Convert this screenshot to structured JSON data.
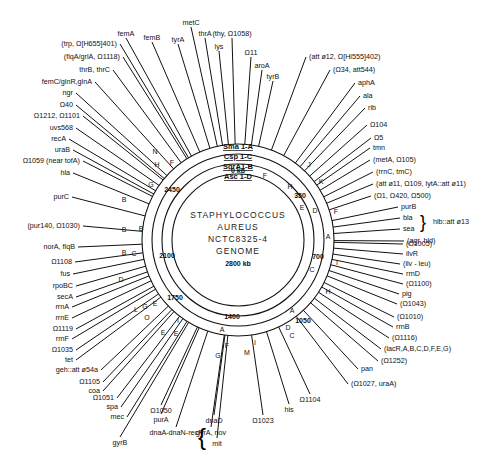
{
  "title": {
    "lines": [
      "STAPHYLOCOCCUS",
      "AUREUS",
      "NCTC8325-4",
      "GENOME"
    ],
    "size": "2800 kb"
  },
  "rings": [
    {
      "name": "Sma 1",
      "label": "Sma 1-A",
      "radius": 96
    },
    {
      "name": "Csp 1",
      "label": "Csp 1-C",
      "radius": 86
    },
    {
      "name": "SgrA1",
      "label": "SgrA1-B",
      "radius": 76
    },
    {
      "name": "Asc 1",
      "label": "Asc 1-D",
      "radius": 66
    }
  ],
  "kb_ticks": [
    {
      "label": "0 kb",
      "x": 238,
      "y": 173
    },
    {
      "label": "350",
      "x": 300,
      "y": 198
    },
    {
      "label": "700",
      "x": 318,
      "y": 259
    },
    {
      "label": "1050",
      "x": 303,
      "y": 323
    },
    {
      "label": "1400",
      "x": 232,
      "y": 319
    },
    {
      "label": "1750",
      "x": 175,
      "y": 300
    },
    {
      "label": "2100",
      "x": 167,
      "y": 258
    },
    {
      "label": "2450",
      "x": 172,
      "y": 192
    }
  ],
  "segments": [
    {
      "t": "F",
      "x": 265,
      "y": 178
    },
    {
      "t": "H",
      "x": 290,
      "y": 189
    },
    {
      "t": "J",
      "x": 309,
      "y": 167
    },
    {
      "t": "K",
      "x": 321,
      "y": 184
    },
    {
      "t": "E",
      "x": 302,
      "y": 210
    },
    {
      "t": "D",
      "x": 315,
      "y": 213
    },
    {
      "t": "F",
      "x": 336,
      "y": 214
    },
    {
      "t": "A",
      "x": 328,
      "y": 239
    },
    {
      "t": "I",
      "x": 337,
      "y": 265
    },
    {
      "t": "C",
      "x": 312,
      "y": 272
    },
    {
      "t": "H",
      "x": 328,
      "y": 294
    },
    {
      "t": "A",
      "x": 292,
      "y": 313
    },
    {
      "t": "D",
      "x": 288,
      "y": 330
    },
    {
      "t": "C",
      "x": 292,
      "y": 338
    },
    {
      "t": "I",
      "x": 255,
      "y": 345
    },
    {
      "t": "M",
      "x": 247,
      "y": 355
    },
    {
      "t": "A",
      "x": 222,
      "y": 332
    },
    {
      "t": "F",
      "x": 227,
      "y": 348
    },
    {
      "t": "G",
      "x": 218,
      "y": 358
    },
    {
      "t": "I",
      "x": 178,
      "y": 323
    },
    {
      "t": "E",
      "x": 176,
      "y": 336
    },
    {
      "t": "E",
      "x": 163,
      "y": 335
    },
    {
      "t": "E",
      "x": 155,
      "y": 306
    },
    {
      "t": "G",
      "x": 145,
      "y": 309
    },
    {
      "t": "L",
      "x": 136,
      "y": 312
    },
    {
      "t": "O",
      "x": 147,
      "y": 320
    },
    {
      "t": "D",
      "x": 121,
      "y": 282
    },
    {
      "t": "C",
      "x": 134,
      "y": 256
    },
    {
      "t": "B",
      "x": 124,
      "y": 255
    },
    {
      "t": "B",
      "x": 141,
      "y": 231
    },
    {
      "t": "B",
      "x": 124,
      "y": 202
    },
    {
      "t": "B",
      "x": 124,
      "y": 232
    },
    {
      "t": "G",
      "x": 151,
      "y": 187
    },
    {
      "t": "H",
      "x": 157,
      "y": 167
    },
    {
      "t": "F",
      "x": 172,
      "y": 165
    },
    {
      "t": "N",
      "x": 155,
      "y": 154
    }
  ],
  "genes_top": [
    {
      "t": "femA",
      "x": 126,
      "y": 36
    },
    {
      "t": "femB",
      "x": 152,
      "y": 40
    },
    {
      "t": "tyrA",
      "x": 178,
      "y": 42
    },
    {
      "t": "metC",
      "x": 191,
      "y": 25
    },
    {
      "t": "thrA",
      "x": 205,
      "y": 36
    },
    {
      "t": "lys",
      "x": 219,
      "y": 49
    },
    {
      "t": "(thy, Ω1058)",
      "x": 232,
      "y": 36
    },
    {
      "t": "Ω11",
      "x": 251,
      "y": 55
    },
    {
      "t": "aroA",
      "x": 262,
      "y": 68
    },
    {
      "t": "tyrB",
      "x": 273,
      "y": 79
    }
  ],
  "genes_left": [
    {
      "t": "(trp, Ω[H655]401)",
      "x": 117,
      "y": 46
    },
    {
      "t": "(flqA/grlA, Ω1118)",
      "x": 120,
      "y": 59
    },
    {
      "t": "thrB, thrC",
      "x": 110,
      "y": 72
    },
    {
      "t": "femC/glnR,glnA",
      "x": 92,
      "y": 84
    },
    {
      "t": "ngr",
      "x": 73,
      "y": 95
    },
    {
      "t": "Ω40",
      "x": 73,
      "y": 107
    },
    {
      "t": "Ω1212, Ω1101",
      "x": 80,
      "y": 118
    },
    {
      "t": "uvs568",
      "x": 73,
      "y": 130
    },
    {
      "t": "recA",
      "x": 66,
      "y": 141
    },
    {
      "t": "uraB",
      "x": 70,
      "y": 152
    },
    {
      "t": "Ω1059 (near tofA)",
      "x": 80,
      "y": 163
    },
    {
      "t": "hla",
      "x": 70,
      "y": 175
    },
    {
      "t": "purC",
      "x": 69,
      "y": 199
    },
    {
      "t": "(pur140, Ω1030)",
      "x": 80,
      "y": 228
    },
    {
      "t": "norA, flqB",
      "x": 75,
      "y": 249
    },
    {
      "t": "Ω1108",
      "x": 72,
      "y": 264
    },
    {
      "t": "fus",
      "x": 70,
      "y": 276
    },
    {
      "t": "rpoBC",
      "x": 73,
      "y": 288
    },
    {
      "t": "secA",
      "x": 73,
      "y": 299
    },
    {
      "t": "rrnA",
      "x": 69,
      "y": 309
    },
    {
      "t": "rrnE",
      "x": 69,
      "y": 320
    },
    {
      "t": "Ω1119",
      "x": 73,
      "y": 331
    },
    {
      "t": "rrnF",
      "x": 69,
      "y": 341
    },
    {
      "t": "Ω1035",
      "x": 73,
      "y": 352
    },
    {
      "t": "tet",
      "x": 73,
      "y": 362
    },
    {
      "t": "geh::att ø54a",
      "x": 98,
      "y": 372
    },
    {
      "t": "Ω1105",
      "x": 100,
      "y": 384
    },
    {
      "t": "coa",
      "x": 100,
      "y": 393
    },
    {
      "t": "Ω1051",
      "x": 114,
      "y": 400
    },
    {
      "t": "spa",
      "x": 118,
      "y": 409
    },
    {
      "t": "mec",
      "x": 124,
      "y": 419
    }
  ],
  "genes_bottom": [
    {
      "t": "Ω1050",
      "x": 161,
      "y": 413
    },
    {
      "t": "purA",
      "x": 161,
      "y": 422
    },
    {
      "t": "dnaD",
      "x": 214,
      "y": 423
    },
    {
      "t": "gyrA, nov",
      "x": 211,
      "y": 435
    },
    {
      "t": "mit",
      "x": 217,
      "y": 446
    },
    {
      "t": "dnaA-dnaN-recF",
      "x": 176,
      "y": 435
    },
    {
      "t": "gyrB",
      "x": 120,
      "y": 445
    },
    {
      "t": "Ω1023",
      "x": 263,
      "y": 423
    },
    {
      "t": "his",
      "x": 289,
      "y": 412
    },
    {
      "t": "Ω1104",
      "x": 310,
      "y": 402
    }
  ],
  "genes_right": [
    {
      "t": "(att ø12, Ω[Hi555]402)",
      "x": 309,
      "y": 59
    },
    {
      "t": "(Ω34, att544)",
      "x": 333,
      "y": 72
    },
    {
      "t": "aphA",
      "x": 358,
      "y": 85
    },
    {
      "t": "ala",
      "x": 363,
      "y": 98
    },
    {
      "t": "rib",
      "x": 368,
      "y": 110
    },
    {
      "t": "Ω104",
      "x": 370,
      "y": 127
    },
    {
      "t": "Ω5",
      "x": 374,
      "y": 140
    },
    {
      "t": "tmn",
      "x": 373,
      "y": 150
    },
    {
      "t": "(metA, Ω105)",
      "x": 373,
      "y": 162
    },
    {
      "t": "(rrnC, tmC)",
      "x": 376,
      "y": 174
    },
    {
      "t": "(att ø11, Ω109, lytA::att ø11)",
      "x": 376,
      "y": 186
    },
    {
      "t": "(Ω1, Ω420, Ω500)",
      "x": 374,
      "y": 198
    },
    {
      "t": "purB",
      "x": 401,
      "y": 209
    },
    {
      "t": "bla",
      "x": 403,
      "y": 220
    },
    {
      "t": "sea",
      "x": 403,
      "y": 231
    },
    {
      "t": "(agr, hld)",
      "x": 407,
      "y": 243
    },
    {
      "t": "(Ω1005)",
      "x": 406,
      "y": 246
    },
    {
      "t": "ilvR",
      "x": 406,
      "y": 256
    },
    {
      "t": "(ilv - leu)",
      "x": 403,
      "y": 266
    },
    {
      "t": "rrnD",
      "x": 406,
      "y": 276
    },
    {
      "t": "(Ω1100)",
      "x": 406,
      "y": 286
    },
    {
      "t": "pig",
      "x": 402,
      "y": 296
    },
    {
      "t": "(Ω1043)",
      "x": 400,
      "y": 306
    },
    {
      "t": "(Ω1010)",
      "x": 397,
      "y": 319
    },
    {
      "t": "rrnB",
      "x": 396,
      "y": 329
    },
    {
      "t": "(Ω1116)",
      "x": 392,
      "y": 340
    },
    {
      "t": "(lacR,A,B,C,D,F,E,G)",
      "x": 384,
      "y": 351
    },
    {
      "t": "(Ω1252)",
      "x": 381,
      "y": 363
    },
    {
      "t": "pan",
      "x": 361,
      "y": 371
    },
    {
      "t": "(Ω1027, uraA)",
      "x": 351,
      "y": 386
    }
  ],
  "brace_labels": {
    "hlb": "hlb::att ø13"
  }
}
